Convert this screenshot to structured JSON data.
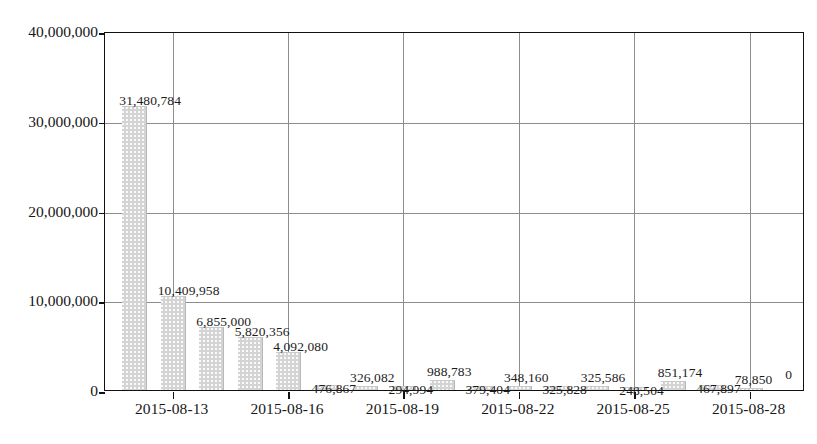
{
  "chart_data": {
    "type": "bar",
    "title": "",
    "subtitle": "",
    "xlabel": "",
    "ylabel": "",
    "grid": true,
    "legend": null,
    "ylim": [
      0,
      40000000
    ],
    "yticks": [
      0,
      10000000,
      20000000,
      30000000,
      40000000
    ],
    "ytick_labels": [
      "0",
      "10,000,000",
      "20,000,000",
      "30,000,000",
      "40,000,000"
    ],
    "xtick_labels": [
      "2015-08-13",
      "2015-08-16",
      "2015-08-19",
      "2015-08-22",
      "2015-08-25",
      "2015-08-28"
    ],
    "categories": [
      "2015-08-12",
      "2015-08-13",
      "2015-08-14",
      "2015-08-15",
      "2015-08-16",
      "2015-08-17",
      "2015-08-18",
      "2015-08-19",
      "2015-08-20",
      "2015-08-21",
      "2015-08-22",
      "2015-08-23",
      "2015-08-24",
      "2015-08-25",
      "2015-08-26",
      "2015-08-27",
      "2015-08-28"
    ],
    "values": [
      31480784,
      10409958,
      6855000,
      5820356,
      4092080,
      476867,
      326082,
      294994,
      988783,
      379404,
      348160,
      325828,
      325586,
      248504,
      851174,
      467897,
      78850
    ],
    "value_labels": [
      "31,480,784",
      "10,409,958",
      "6,855,000",
      "5,820,356",
      "4,092,080",
      "476,867",
      "326,082",
      "294,994",
      "988,783",
      "379,404",
      "348,160",
      "325,828",
      "325,586",
      "248,504",
      "851,174",
      "467,897",
      "78,850"
    ],
    "trailing_label": "0",
    "bar_color": "#d4d4d4",
    "grid_color": "#8d8d8d",
    "axis_color": "#111111",
    "text_color": "#171717"
  }
}
